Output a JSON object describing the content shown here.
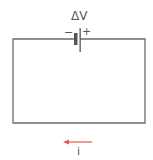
{
  "diagram": {
    "battery": {
      "label": "ΔV",
      "negative_sign": "−",
      "positive_sign": "+"
    },
    "current": {
      "label": "i",
      "direction": "left",
      "arrow_color": "#e8574a"
    },
    "colors": {
      "wire": "#6b6b6b",
      "text": "#555555"
    }
  }
}
